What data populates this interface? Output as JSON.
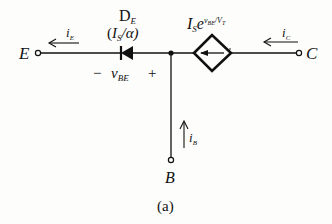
{
  "diagram": {
    "caption": "(a)",
    "terminals": {
      "emitter": "E",
      "collector": "C",
      "base": "B"
    },
    "currents": {
      "i_E": {
        "main": "i",
        "sub": "E"
      },
      "i_C": {
        "main": "i",
        "sub": "C"
      },
      "i_B": {
        "main": "i",
        "sub": "B"
      }
    },
    "diode": {
      "name_main": "D",
      "name_sub": "E",
      "param_open": "(",
      "param_I": "I",
      "param_S": "S",
      "param_rest": "/α)"
    },
    "vbe": {
      "minus": "−",
      "plus": "+",
      "main": "v",
      "sub": "BE"
    },
    "source": {
      "I": "I",
      "S": "S",
      "e": "e",
      "exp_v": "v",
      "exp_sub": "BE",
      "exp_slash": "/V",
      "exp_T": "T"
    },
    "colors": {
      "ink": "#111111",
      "background": "#fdfdfb"
    }
  }
}
